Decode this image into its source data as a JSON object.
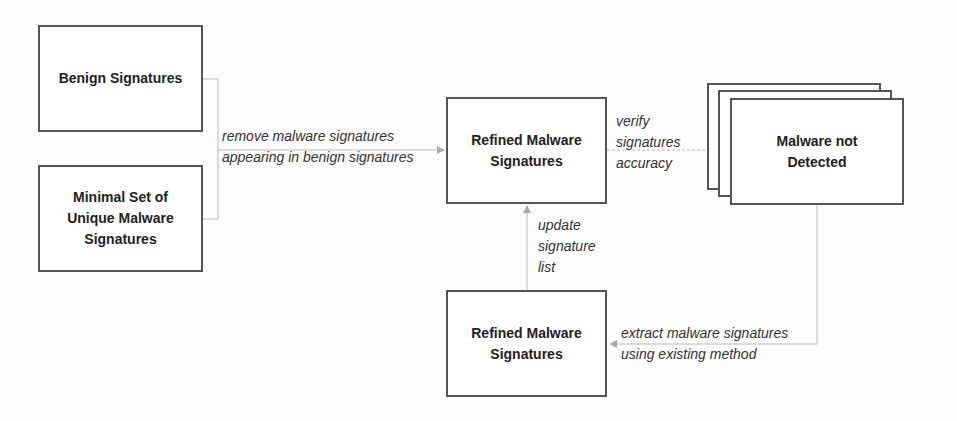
{
  "diagram": {
    "nodes": {
      "benign": {
        "label": "Benign Signatures"
      },
      "minimal": {
        "label": "Minimal Set of\nUnique Malware\nSignatures"
      },
      "refined_top": {
        "label": "Refined Malware\nSignatures"
      },
      "not_detected": {
        "label": "Malware not\nDetected"
      },
      "refined_bottom": {
        "label": "Refined Malware\nSignatures"
      }
    },
    "edges": {
      "remove": {
        "label": "remove malware signatures\nappearing in benign signatures"
      },
      "verify": {
        "label": "verify\nsignatures\naccuracy"
      },
      "update": {
        "label": "update\nsignature\nlist"
      },
      "extract": {
        "label": "extract malware signatures\nusing existing method"
      }
    },
    "colors": {
      "box_border": "#555555",
      "arrow": "#aaaaaa",
      "text": "#222222"
    }
  }
}
